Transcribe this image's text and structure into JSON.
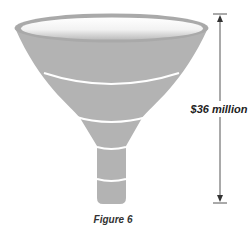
{
  "figure": {
    "caption": "Figure 6",
    "dimension_label": "$36 million",
    "colors": {
      "funnel_fill": "#b3b3b3",
      "funnel_rim": "#a9a9a9",
      "funnel_inner_top": "#ffffff",
      "band_color": "#ffffff",
      "arrow_color": "#555555",
      "text_color": "#222222"
    },
    "funnel": {
      "sections": 5,
      "description": "Funnel divided into stacked segments by white bands, with a measuring arrow spanning its full height"
    },
    "arrow": {
      "direction": "double-headed vertical",
      "span": "full funnel height"
    }
  }
}
